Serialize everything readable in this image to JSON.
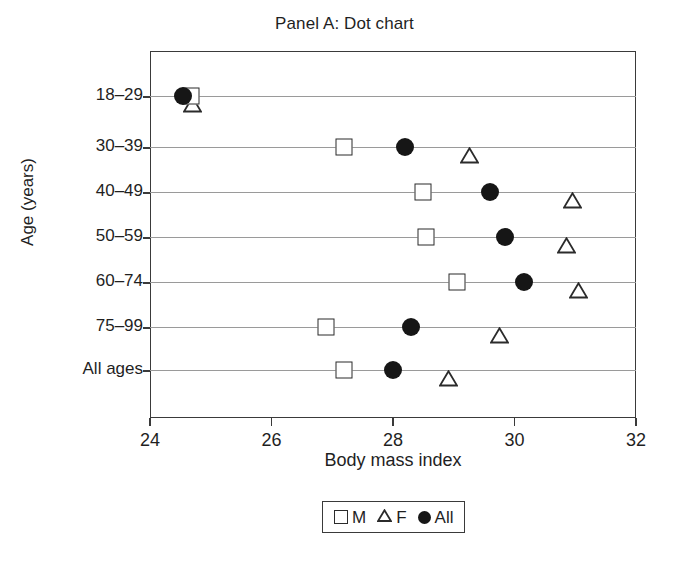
{
  "chart_data": {
    "type": "scatter",
    "title": "Panel A: Dot chart",
    "xlabel": "Body mass index",
    "ylabel": "Age (years)",
    "xlim": [
      24,
      32
    ],
    "xticks": [
      24,
      26,
      28,
      30,
      32
    ],
    "xtick_labels": [
      "24",
      "26",
      "28",
      "30",
      "32"
    ],
    "categories": [
      "18–29",
      "30–39",
      "40–49",
      "50–59",
      "60–74",
      "75–99",
      "All ages"
    ],
    "grid": "horizontal",
    "legend_position": "below-axis-centered",
    "series": [
      {
        "name": "M",
        "marker": "open-square",
        "color": "#2b2b2b",
        "values": [
          24.68,
          27.2,
          28.5,
          28.55,
          29.05,
          26.9,
          27.2
        ]
      },
      {
        "name": "F",
        "marker": "open-triangle",
        "color": "#2b2b2b",
        "values": [
          24.55,
          29.1,
          30.8,
          30.7,
          30.9,
          29.6,
          28.75
        ]
      },
      {
        "name": "All",
        "marker": "filled-circle",
        "color": "#161616",
        "values": [
          24.55,
          28.2,
          29.6,
          29.85,
          30.15,
          28.3,
          28.0
        ]
      }
    ]
  },
  "legend": {
    "items": [
      {
        "label": "M",
        "marker": "open-square"
      },
      {
        "label": "F",
        "marker": "open-triangle"
      },
      {
        "label": "All",
        "marker": "filled-circle"
      }
    ]
  },
  "colors": {
    "axis": "#3a3a3a",
    "grid": "#9a9a9a",
    "text": "#1f1f1f",
    "marker_outline": "#2b2b2b",
    "marker_fill": "#161616",
    "background": "#ffffff"
  }
}
